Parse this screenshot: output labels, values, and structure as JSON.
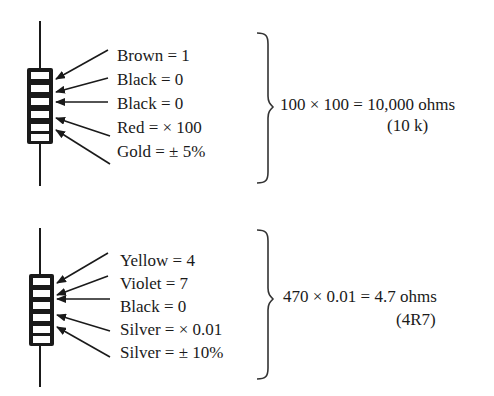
{
  "colors": {
    "ink": "#1a1a1a",
    "background": "#ffffff"
  },
  "examples": [
    {
      "bands": [
        {
          "label": "Brown = 1"
        },
        {
          "label": "Black = 0"
        },
        {
          "label": "Black = 0"
        },
        {
          "label": "Red = × 100"
        },
        {
          "label": "Gold = ± 5%"
        }
      ],
      "result": "100 × 100 = 10,000 ohms",
      "code": "(10 k)"
    },
    {
      "bands": [
        {
          "label": "Yellow = 4"
        },
        {
          "label": "Violet = 7"
        },
        {
          "label": "Black = 0"
        },
        {
          "label": "Silver = × 0.01"
        },
        {
          "label": "Silver = ± 10%"
        }
      ],
      "result": "470 × 0.01 = 4.7 ohms",
      "code": "(4R7)"
    }
  ]
}
